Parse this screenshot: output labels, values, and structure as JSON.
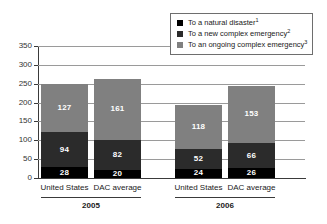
{
  "chart_data": {
    "type": "bar",
    "stacked": true,
    "title": "",
    "xlabel": "",
    "ylabel": "",
    "ylim": [
      0,
      350
    ],
    "yticks": [
      0,
      50,
      100,
      150,
      200,
      250,
      300,
      350
    ],
    "ytick_labels": [
      "0",
      "50",
      "100",
      "150",
      "200",
      "250",
      "300",
      "350"
    ],
    "grid": "horizontal",
    "legend_position": "top-right",
    "categories": [
      "United States",
      "DAC average",
      "United States",
      "DAC average"
    ],
    "groups": [
      {
        "label": "2005",
        "categories": [
          "United States",
          "DAC average"
        ]
      },
      {
        "label": "2006",
        "categories": [
          "United States",
          "DAC average"
        ]
      }
    ],
    "series": [
      {
        "name": "To a natural disaster",
        "footnote": "1",
        "color": "#000000",
        "values": [
          28,
          20,
          24,
          26
        ]
      },
      {
        "name": "To a new complex emergency",
        "footnote": "2",
        "color": "#2b2b2b",
        "values": [
          94,
          82,
          52,
          66
        ]
      },
      {
        "name": "To an ongoing complex emergency",
        "footnote": "3",
        "color": "#808080",
        "values": [
          127,
          161,
          118,
          153
        ]
      }
    ],
    "bars": [
      {
        "group": "2005",
        "category": "United States",
        "segments": [
          {
            "series": "To a natural disaster",
            "value": 28,
            "label": "28",
            "color": "#000000"
          },
          {
            "series": "To a new complex emergency",
            "value": 94,
            "label": "94",
            "color": "#2b2b2b"
          },
          {
            "series": "To an ongoing complex emergency",
            "value": 127,
            "label": "127",
            "color": "#808080"
          }
        ],
        "total": 249
      },
      {
        "group": "2005",
        "category": "DAC average",
        "segments": [
          {
            "series": "To a natural disaster",
            "value": 20,
            "label": "20",
            "color": "#000000"
          },
          {
            "series": "To a new complex emergency",
            "value": 82,
            "label": "82",
            "color": "#2b2b2b"
          },
          {
            "series": "To an ongoing complex emergency",
            "value": 161,
            "label": "161",
            "color": "#808080"
          }
        ],
        "total": 263
      },
      {
        "group": "2006",
        "category": "United States",
        "segments": [
          {
            "series": "To a natural disaster",
            "value": 24,
            "label": "24",
            "color": "#000000"
          },
          {
            "series": "To a new complex emergency",
            "value": 52,
            "label": "52",
            "color": "#2b2b2b"
          },
          {
            "series": "To an ongoing complex emergency",
            "value": 118,
            "label": "118",
            "color": "#808080"
          }
        ],
        "total": 194
      },
      {
        "group": "2006",
        "category": "DAC average",
        "segments": [
          {
            "series": "To a natural disaster",
            "value": 26,
            "label": "26",
            "color": "#000000"
          },
          {
            "series": "To a new complex emergency",
            "value": 66,
            "label": "66",
            "color": "#2b2b2b"
          },
          {
            "series": "To an ongoing complex emergency",
            "value": 153,
            "label": "153",
            "color": "#808080"
          }
        ],
        "total": 245
      }
    ]
  },
  "legend": {
    "items": [
      {
        "label": "To a natural disaster",
        "footnote": "1",
        "color": "#000000"
      },
      {
        "label": "To a new complex emergency",
        "footnote": "2",
        "color": "#2b2b2b"
      },
      {
        "label": "To an ongoing complex emergency",
        "footnote": "3",
        "color": "#808080"
      }
    ]
  },
  "colors": {
    "natural_disaster": "#000000",
    "new_complex_emergency": "#2b2b2b",
    "ongoing_complex_emergency": "#808080",
    "axis": "#3a3a3a",
    "gridline": "#9a9a9a",
    "value_label": "#ffffff"
  }
}
